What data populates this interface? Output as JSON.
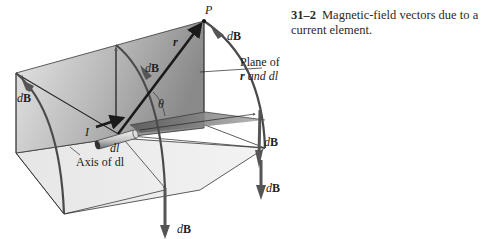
{
  "figure": {
    "caption_number": "31–2",
    "caption_text": "Magnetic-field vectors due to a current element.",
    "labels": {
      "point": "P",
      "position_vector": "r",
      "angle": "θ",
      "current": "I",
      "element": "dl",
      "axis": "Axis of dl",
      "plane_line1": "Plane of",
      "plane_line2_r": "r",
      "plane_line2_rest": " and dl",
      "field_d": "d",
      "field_B": "B"
    },
    "colors": {
      "plane_dark": "#8f8f8f",
      "plane_light": "#e6e6e6",
      "floor": "#d9d9d9",
      "arc": "#4a4a4a",
      "arrow": "#1a1a1a",
      "field_arrow": "#5a5a5a"
    }
  }
}
